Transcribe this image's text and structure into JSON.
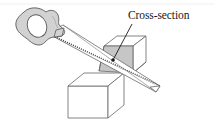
{
  "figure": {
    "background_color": "#ffffff",
    "annotation": {
      "label": "Cross-section",
      "label_x": 128,
      "label_y": 19,
      "leader_from_x": 132,
      "leader_from_y": 24,
      "leader_to_x": 113,
      "leader_to_y": 60,
      "dot_x": 113,
      "dot_y": 60,
      "dot_radius": 1.8,
      "leader_color": "#1a1a1a"
    },
    "top_rule": {
      "visible": true,
      "y": 4,
      "color": "#e8e8e8"
    },
    "colors": {
      "outline": "#555555",
      "cross_section_fill": "#c6c6c6",
      "handle_fill": "#d2d2d2",
      "handle_outline": "#5a5a5a",
      "blade_fill": "#ffffff",
      "cube_fill": "#ffffff",
      "cube_top_fill": "#fdfdfd",
      "text": "#1a1a1a"
    },
    "objects": [
      {
        "name": "saw-handle",
        "type": "grip",
        "description": "gray irregular pistol grip with oval hand hole"
      },
      {
        "name": "saw-blade",
        "type": "blade",
        "description": "long tapered blade with toothed lower edge"
      },
      {
        "name": "cut-cube",
        "type": "cube",
        "description": "cube sliced diagonally exposing shaded triangular cross-section"
      },
      {
        "name": "lower-cube",
        "type": "cube",
        "description": "plain wireframe cube below left"
      }
    ]
  }
}
